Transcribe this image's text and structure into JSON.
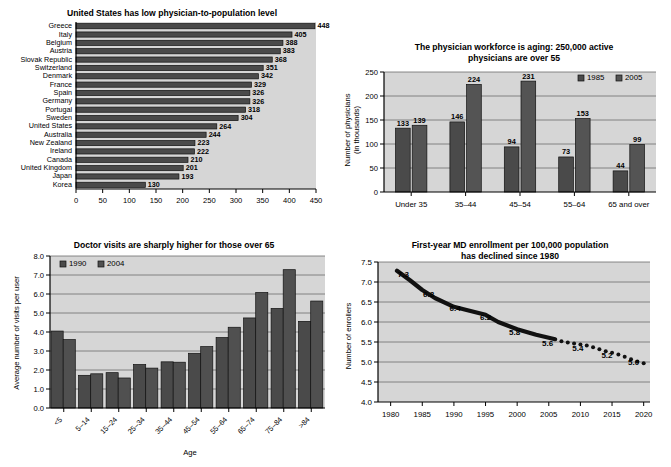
{
  "figure": {
    "background": "#ffffff",
    "plot_background": "#d2d2d2",
    "bar_color_series1": "#4a4a4a",
    "bar_color_series2": "#585858"
  },
  "chart_data": [
    {
      "id": "physician-population",
      "type": "bar",
      "orientation": "horizontal",
      "title": "United States has low physician-to-population level",
      "xlabel": "",
      "ylabel": "",
      "xlim": [
        0,
        450
      ],
      "xticks": [
        0,
        50,
        100,
        150,
        200,
        250,
        300,
        350,
        400,
        450
      ],
      "grid": false,
      "legend": null,
      "categories": [
        "Greece",
        "Italy",
        "Belgium",
        "Austria",
        "Slovak Republic",
        "Switzerland",
        "Denmark",
        "France",
        "Spain",
        "Germany",
        "Portugal",
        "Sweden",
        "United States",
        "Australia",
        "New Zealand",
        "Ireland",
        "Canada",
        "United Kingdom",
        "Japan",
        "Korea"
      ],
      "values": [
        448,
        405,
        388,
        383,
        368,
        351,
        342,
        329,
        326,
        326,
        318,
        304,
        264,
        244,
        223,
        222,
        210,
        201,
        193,
        130
      ]
    },
    {
      "id": "workforce-aging",
      "type": "bar",
      "orientation": "vertical",
      "title": "The physician workforce is aging: 250,000 active physicians are over 55",
      "title_lines": [
        "The physician workforce is aging: 250,000 active",
        "physicians are over 55"
      ],
      "xlabel": "",
      "ylabel": "Number of physicians (in thousands)",
      "ylabel_lines": [
        "Number of physicians",
        "(in thousands)"
      ],
      "ylim": [
        0,
        250
      ],
      "yticks": [
        0,
        50,
        100,
        150,
        200,
        250
      ],
      "grid": true,
      "legend_position": "top-right",
      "categories": [
        "Under 35",
        "35–44",
        "45–54",
        "55–64",
        "65 and over"
      ],
      "series": [
        {
          "name": "1985",
          "values": [
            133,
            146,
            94,
            73,
            44
          ]
        },
        {
          "name": "2005",
          "values": [
            139,
            224,
            231,
            153,
            99
          ]
        }
      ]
    },
    {
      "id": "doctor-visits",
      "type": "bar",
      "orientation": "vertical",
      "title": "Doctor visits are sharply higher for those over 65",
      "xlabel": "Age",
      "ylabel": "Average number of visits per user",
      "ylim": [
        0.0,
        8.0
      ],
      "yticks": [
        "0.0",
        "1.0",
        "2.0",
        "3.0",
        "4.0",
        "5.0",
        "6.0",
        "7.0",
        "8.0"
      ],
      "grid": true,
      "legend_position": "top-left",
      "categories": [
        "<5",
        "5–14",
        "15–24",
        "25–34",
        "35–44",
        "45–54",
        "55–64",
        "65–74",
        "75–84",
        ">84"
      ],
      "series": [
        {
          "name": "1990",
          "values": [
            4.05,
            1.72,
            1.86,
            2.29,
            2.43,
            2.88,
            3.71,
            4.74,
            5.24,
            4.56
          ]
        },
        {
          "name": "2004",
          "values": [
            3.6,
            1.8,
            1.58,
            2.1,
            2.41,
            3.23,
            4.25,
            6.08,
            7.28,
            5.63
          ]
        }
      ]
    },
    {
      "id": "md-enrollment",
      "type": "line",
      "title": "First-year MD enrollment per 100,000 population has declined since 1980",
      "title_lines": [
        "First-year MD enrollment per 100,000 population",
        "has declined since 1980"
      ],
      "xlabel": "",
      "ylabel": "Number of enrollers",
      "ylim": [
        4.0,
        7.5
      ],
      "yticks": [
        "4.0",
        "4.5",
        "5.0",
        "5.5",
        "6.0",
        "6.5",
        "7.0",
        "7.5"
      ],
      "xlim": [
        1978,
        2021
      ],
      "xticks": [
        1980,
        1985,
        1990,
        1995,
        2000,
        2005,
        2010,
        2015,
        2020
      ],
      "grid": true,
      "legend": null,
      "annotations": [
        "7.3",
        "6.8",
        "6.4",
        "6.2",
        "5.8",
        "5.6",
        "5.4",
        "5.2",
        "5.0"
      ],
      "solid_segment": {
        "x": [
          1981,
          1983,
          1985,
          1987,
          1990,
          1992,
          1995,
          1997,
          2000,
          2003,
          2006
        ],
        "y": [
          7.28,
          7.05,
          6.8,
          6.6,
          6.38,
          6.3,
          6.18,
          6.0,
          5.82,
          5.68,
          5.57
        ]
      },
      "dotted_segment": {
        "x": [
          2007,
          2008,
          2009,
          2010,
          2011,
          2012,
          2013,
          2014,
          2015,
          2016,
          2017,
          2018,
          2019,
          2020
        ],
        "y": [
          5.52,
          5.49,
          5.46,
          5.44,
          5.41,
          5.37,
          5.32,
          5.27,
          5.23,
          5.19,
          5.13,
          5.07,
          5.01,
          4.97
        ]
      }
    }
  ]
}
